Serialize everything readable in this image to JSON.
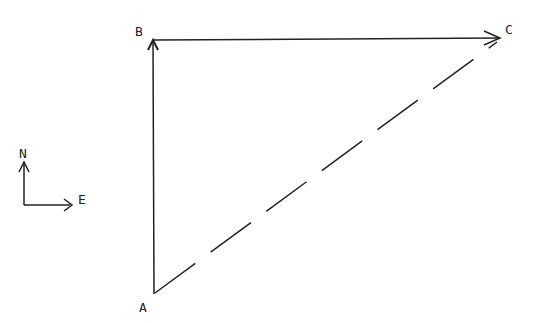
{
  "diagram": {
    "type": "vector-triangle",
    "points": {
      "A": {
        "label": "A",
        "x": 154,
        "y": 294
      },
      "B": {
        "label": "B",
        "x": 153,
        "y": 40
      },
      "C": {
        "label": "C",
        "x": 500,
        "y": 38
      }
    },
    "vectors": [
      {
        "from": "A",
        "to": "B",
        "style": "solid",
        "arrow": true
      },
      {
        "from": "B",
        "to": "C",
        "style": "solid",
        "arrow": true
      },
      {
        "from": "A",
        "to": "C",
        "style": "dashed",
        "arrow": false
      }
    ],
    "compass": {
      "north_label": "N",
      "east_label": "E"
    },
    "stroke_color": "#222222"
  }
}
